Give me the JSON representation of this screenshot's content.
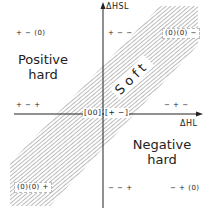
{
  "axes": {
    "y_label": "ΔHSL",
    "x_label": "ΔHL"
  },
  "regions": {
    "positive_hard": "Positive\nhard",
    "negative_hard": "Negative\nhard",
    "soft": "Soft"
  },
  "points": {
    "top_left": "+ − (0)",
    "top_center": "+ − −",
    "top_right": "(0)(0) −",
    "mid_left": "+ − +",
    "mid_right": "− + −",
    "center_left": "[00]",
    "center_right": "[+ −]",
    "bottom_left": "(0)(0) +",
    "bottom_center": "− − +",
    "bottom_right": "− + (0)"
  },
  "colors": {
    "line": "#222222",
    "hatch": "#555555",
    "background": "#ffffff"
  }
}
